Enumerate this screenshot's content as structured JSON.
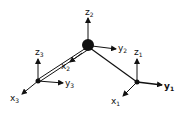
{
  "diagram": {
    "type": "coordinate-frames-linkage",
    "nodes": [
      {
        "id": "node-2",
        "role": "central"
      },
      {
        "id": "node-3",
        "role": "left"
      },
      {
        "id": "node-1",
        "role": "right"
      }
    ],
    "axis_labels": {
      "z2": {
        "base": "z",
        "sub": "2"
      },
      "y2": {
        "base": "y",
        "sub": "2"
      },
      "x2": {
        "base": "x",
        "sub": "2"
      },
      "z3": {
        "base": "z",
        "sub": "3"
      },
      "y3": {
        "base": "y",
        "sub": "3"
      },
      "x3": {
        "base": "x",
        "sub": "3"
      },
      "z1": {
        "base": "z",
        "sub": "1"
      },
      "y1": {
        "base": "y",
        "sub": "1"
      },
      "x1": {
        "base": "x",
        "sub": "1"
      }
    },
    "colors": {
      "stroke": "#111111",
      "background": "#ffffff"
    }
  }
}
